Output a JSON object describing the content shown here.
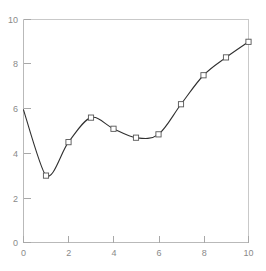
{
  "chart_data": {
    "type": "line",
    "title": "",
    "subtitle": "",
    "xlabel": "",
    "ylabel": "",
    "xlim": [
      0,
      10
    ],
    "ylim": [
      0,
      10
    ],
    "grid": false,
    "legend": false,
    "x_ticks": [
      0,
      2,
      4,
      6,
      8,
      10
    ],
    "y_ticks": [
      0,
      2,
      4,
      6,
      8,
      10
    ],
    "x_tick_labels": [
      "0",
      "2",
      "4",
      "6",
      "8",
      "10"
    ],
    "y_tick_labels": [
      "0",
      "2",
      "4",
      "6",
      "8",
      "10"
    ],
    "marker": "open-square",
    "line_color": "#303030",
    "marker_edge_color": "#555555",
    "marker_face_color": "#ffffff",
    "axis_color": "#b9b9b9",
    "tick_label_color": "#8a8a8a",
    "background_color": "#ffffff",
    "series": [
      {
        "name": "series-1",
        "x": [
          1,
          2,
          3,
          4,
          5,
          6,
          7,
          8,
          9,
          10
        ],
        "values": [
          3.0,
          4.5,
          5.6,
          5.1,
          4.7,
          4.85,
          6.2,
          7.5,
          8.3,
          9.0
        ]
      }
    ],
    "curve_start": {
      "x": 0,
      "y": 5.95
    },
    "annotations": []
  },
  "axes": {
    "x_tick_labels": [
      "0",
      "2",
      "4",
      "6",
      "8",
      "10"
    ],
    "y_tick_labels": [
      "0",
      "2",
      "4",
      "6",
      "8",
      "10"
    ]
  }
}
